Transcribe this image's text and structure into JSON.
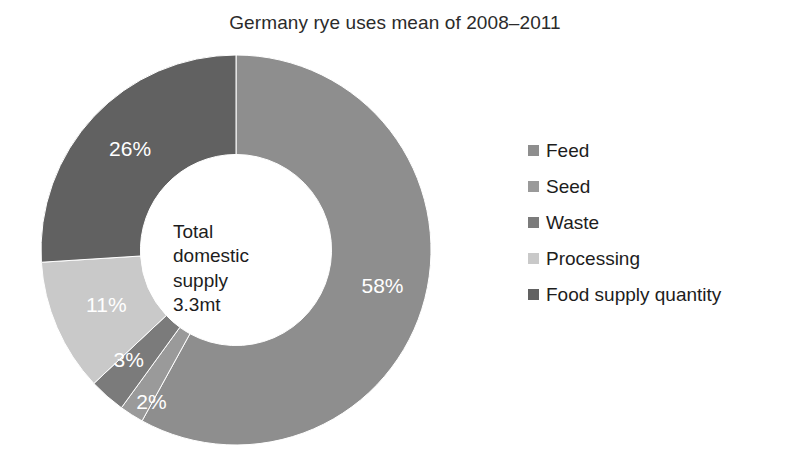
{
  "chart_data": {
    "type": "pie",
    "variant": "donut",
    "title": "Germany rye uses mean of 2008–2011",
    "xlabel": "",
    "ylabel": "",
    "grid": false,
    "legend_position": "right",
    "start_angle_deg": 0,
    "direction": "clockwise",
    "inner_radius_ratio": 0.49,
    "units": "percent",
    "center_annotation": {
      "lines": [
        "Total",
        "domestic",
        "supply",
        "3.3mt"
      ],
      "total_label": "Total domestic supply",
      "total_value": "3.3mt"
    },
    "categories": [
      "Feed",
      "Seed",
      "Waste",
      "Processing",
      "Food supply quantity"
    ],
    "values": [
      58,
      2,
      3,
      11,
      26
    ],
    "data_labels": [
      "58%",
      "2%",
      "3%",
      "11%",
      "26%"
    ],
    "colors": [
      "#8e8e8e",
      "#9a9a9a",
      "#7b7b7b",
      "#c9c9c9",
      "#616161"
    ],
    "slices": [
      {
        "name": "Feed",
        "value": 58,
        "label": "58%",
        "color": "#8e8e8e",
        "label_color": "#ffffff"
      },
      {
        "name": "Seed",
        "value": 2,
        "label": "2%",
        "color": "#9a9a9a",
        "label_color": "#ffffff"
      },
      {
        "name": "Waste",
        "value": 3,
        "label": "3%",
        "color": "#7b7b7b",
        "label_color": "#ffffff"
      },
      {
        "name": "Processing",
        "value": 11,
        "label": "11%",
        "color": "#c9c9c9",
        "label_color": "#ffffff"
      },
      {
        "name": "Food supply quantity",
        "value": 26,
        "label": "26%",
        "color": "#616161",
        "label_color": "#ffffff"
      }
    ]
  },
  "legend": {
    "items": [
      {
        "label": "Feed",
        "color": "#8e8e8e"
      },
      {
        "label": "Seed",
        "color": "#9a9a9a"
      },
      {
        "label": "Waste",
        "color": "#7b7b7b"
      },
      {
        "label": "Processing",
        "color": "#c9c9c9"
      },
      {
        "label": "Food supply quantity",
        "color": "#616161"
      }
    ]
  }
}
